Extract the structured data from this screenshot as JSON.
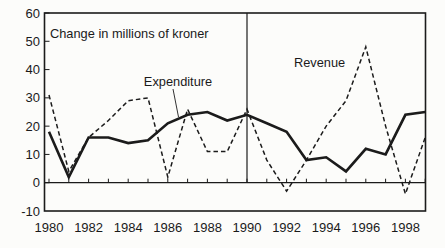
{
  "figure": {
    "background": "#fcfcfa",
    "ink": "#1b1b1b"
  },
  "chart_data": {
    "type": "line",
    "title": "Change in millions of kroner",
    "xlabel": "",
    "ylabel": "",
    "x": [
      1980,
      1981,
      1982,
      1983,
      1984,
      1985,
      1986,
      1987,
      1988,
      1989,
      1990,
      1991,
      1992,
      1993,
      1994,
      1995,
      1996,
      1997,
      1998,
      1999
    ],
    "series": [
      {
        "name": "Expenditure",
        "line_style": "solid",
        "values": [
          18,
          2,
          16,
          16,
          14,
          15,
          21,
          24,
          25,
          22,
          24,
          21,
          18,
          8,
          9,
          4,
          12,
          10,
          24,
          25
        ]
      },
      {
        "name": "Revenue",
        "line_style": "dashed",
        "values": [
          31,
          4,
          16,
          22,
          29,
          30,
          2,
          26,
          11,
          11,
          26,
          8,
          -3,
          8,
          20,
          29,
          48,
          20,
          -4,
          16
        ]
      }
    ],
    "ylim": [
      -10,
      60
    ],
    "yticks": [
      60,
      50,
      40,
      30,
      20,
      10,
      0,
      -10
    ],
    "xtick_labels": [
      "1980",
      "1982",
      "1984",
      "1986",
      "1988",
      "1990",
      "1992",
      "1994",
      "1996",
      "1998"
    ],
    "xtick_minor_step": 1,
    "reference_line_x": 1990,
    "grid": false,
    "legend_position": "inline-labels"
  }
}
